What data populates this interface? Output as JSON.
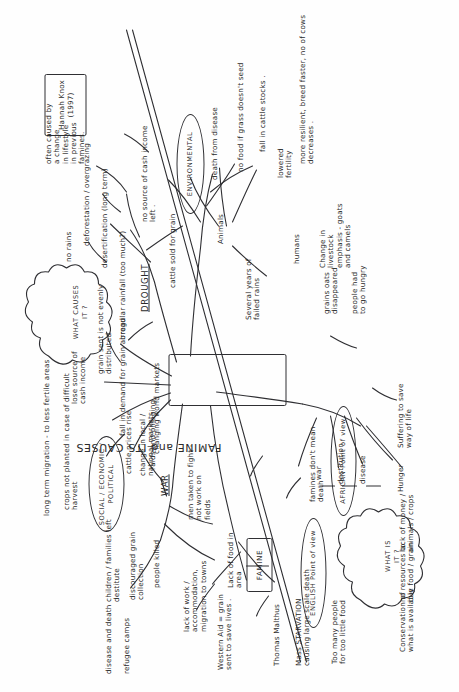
{
  "document": {
    "type": "hand-drawn mind map",
    "title": "FAMINE and ITS CAUSES",
    "orientation": "landscape sheet photographed in portrait (text runs sideways)",
    "ink_color": "#2f2f33",
    "paper_color": "#fefefe"
  },
  "center": {
    "label": "FAMINE and ITS CAUSES"
  },
  "attribution": {
    "name": "Hannah Knox (1997)"
  },
  "clouds": {
    "what_causes_it": "WHAT  CAUSES\nIT ?",
    "what_is_it": "WHAT  IS\nIT ?"
  },
  "branches": {
    "social_economic_political": {
      "label": "SOCIAL / ECONOMIC /\nPOLITICAL",
      "notes": [
        "long term migration - to less fertile areas",
        "crops not planted in case of difficult\nharvest",
        "lose source of\ncash income",
        "fall in demand for grain abroad",
        "grain sent is not evenly\ndistributed",
        "changing world markets",
        "cattle prices rise",
        "change in local /\nnational markets"
      ]
    },
    "war": {
      "label": "WAR",
      "notes": [
        "raids and pillaging",
        "men taken to fight -\nnot work on\nfields",
        "children / families left\ndestitute",
        "discouraged grain\ncollection",
        "people killed",
        "lack of work /\naccommodation,\nmigration to towns",
        "disease and death",
        "refugee camps"
      ]
    },
    "drought": {
      "label": "DROUGHT",
      "notes": [
        "irregular rainfall (too much?)",
        "no rains",
        "desertification (long term)",
        "deforestation / overgrazing",
        "often caused by\na change\nin lifestyle\nin previous\nfamines.",
        "cattle sold for grain",
        "no source of cash income\nleft ."
      ]
    },
    "environmental": {
      "label": "ENVIRONMENTAL",
      "notes": [
        "Several years of\nfailed rains",
        "Animals",
        "humans",
        "death from disease",
        "no food if grass doesn't seed",
        "fall in cattle stocks .",
        "lowered\nfertility",
        "more resilient, breed faster, no of cows decreases .",
        "Change in\nlivestock\nemphasis - goats\nand camels",
        "grains oats\ndisappeared",
        "people had\nto go hungry"
      ]
    },
    "english_point_of_view": {
      "label": "ENGLISH  Point of view",
      "notes": [
        "Western Aid = grain\nsent to save lives .",
        "Lack of food in\narea",
        "Thomas Malthus",
        "Mass STARVATION\ncausing large scale death",
        "Too many people\nfor too little food",
        "FAMINE"
      ]
    },
    "african_point_of_view": {
      "label": "AFRICAN  Point of view",
      "notes": [
        "famines don't mean\ndeath",
        "war",
        "destitution",
        "disease",
        "Hunger",
        "Suffering to save\nway of life",
        "lack of money /\nanimals / crops",
        "no resources to\nbuy food / grain",
        "Conservation of\nwhat is available"
      ]
    }
  }
}
